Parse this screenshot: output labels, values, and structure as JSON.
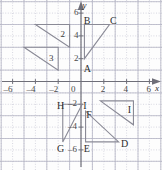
{
  "figure": {
    "type": "coordinate-grid-diagram",
    "title": "",
    "axis_x_name": "x",
    "axis_y_name": "y",
    "origin_label": "0"
  },
  "grid": {
    "x_min": -7,
    "x_max": 7,
    "y_min": -7,
    "y_max": 7,
    "step": 1,
    "gridline_color": "#c9c9d6",
    "axis_color": "#6e6e78"
  },
  "ticks": {
    "x": [
      {
        "value": -6,
        "label": "–6"
      },
      {
        "value": -4,
        "label": "–4"
      },
      {
        "value": -2,
        "label": "–2"
      },
      {
        "value": 2,
        "label": "2"
      },
      {
        "value": 4,
        "label": "4"
      },
      {
        "value": 6,
        "label": "6"
      }
    ],
    "y": [
      {
        "value": 6,
        "label": "6"
      },
      {
        "value": 4,
        "label": "4"
      },
      {
        "value": 2,
        "label": "2"
      },
      {
        "value": -2,
        "label": "–2"
      },
      {
        "value": -4,
        "label": "–4"
      },
      {
        "value": -6,
        "label": "–6"
      }
    ]
  },
  "shapes": [
    {
      "name": "triangle-upper-left-2",
      "points": "-4,5 -1,5 -1,3",
      "inner_label": "2",
      "inner_label_x": -1.8,
      "inner_label_y": 4.5
    },
    {
      "name": "triangle-left-3",
      "points": "-5,3 -2,3 -2,1",
      "inner_label": "3",
      "inner_label_x": -2.8,
      "inner_label_y": 2.4
    },
    {
      "name": "triangle-abc",
      "points": "0.3,2 0.3,5 2.5,5"
    },
    {
      "name": "triangle-ghi",
      "points": "-1.6,-2 0.1,-2 -1.6,-5.3"
    },
    {
      "name": "triangle-def",
      "points": "0.4,-2.6 0.4,-5.3 3.3,-5.3"
    },
    {
      "name": "triangle-right-i",
      "points": "1.7,-1.7 4.6,-1.7 4.6,-3.8"
    }
  ],
  "vertex_labels": [
    {
      "name": "vertex-label-a",
      "text": "A",
      "x": 0.25,
      "y": 1.55
    },
    {
      "name": "vertex-label-b",
      "text": "B",
      "x": 0.25,
      "y": 5.75
    },
    {
      "name": "vertex-label-c",
      "text": "C",
      "x": 2.55,
      "y": 5.75
    },
    {
      "name": "vertex-label-d",
      "text": "D",
      "x": 3.5,
      "y": -5.05
    },
    {
      "name": "vertex-label-e",
      "text": "E",
      "x": 0.25,
      "y": -5.45
    },
    {
      "name": "vertex-label-f",
      "text": "F",
      "x": 0.45,
      "y": -2.5
    },
    {
      "name": "vertex-label-g",
      "text": "G",
      "x": -2.1,
      "y": -5.5
    },
    {
      "name": "vertex-label-h",
      "text": "H",
      "x": -2.1,
      "y": -1.75
    },
    {
      "name": "vertex-label-i",
      "text": "I",
      "x": 0.2,
      "y": -1.75
    },
    {
      "name": "vertex-label-i2",
      "text": "I",
      "x": 4.1,
      "y": -2.1
    }
  ],
  "chart_data": {
    "type": "scatter",
    "title": "",
    "xlabel": "x",
    "ylabel": "y",
    "xlim": [
      -7,
      7
    ],
    "ylim": [
      -7,
      7
    ],
    "grid": true,
    "legend": "none",
    "annotations": [
      "A",
      "B",
      "C",
      "D",
      "E",
      "F",
      "G",
      "H",
      "I",
      "I",
      "2",
      "3"
    ]
  }
}
